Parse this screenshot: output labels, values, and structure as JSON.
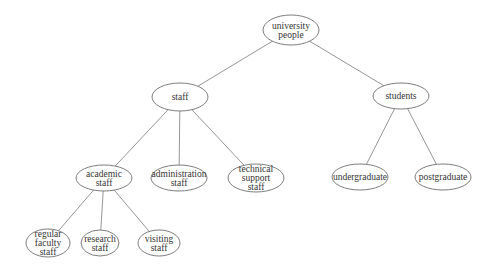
{
  "diagram": {
    "type": "tree",
    "nodes": [
      {
        "id": "root",
        "lines": [
          "university",
          "people"
        ],
        "cx": 291,
        "cy": 30,
        "rx": 28,
        "ry": 15
      },
      {
        "id": "staff",
        "lines": [
          "staff"
        ],
        "cx": 180,
        "cy": 97,
        "rx": 28,
        "ry": 14
      },
      {
        "id": "students",
        "lines": [
          "students"
        ],
        "cx": 401,
        "cy": 96,
        "rx": 28,
        "ry": 13
      },
      {
        "id": "academic",
        "lines": [
          "academic",
          "staff"
        ],
        "cx": 104,
        "cy": 178,
        "rx": 28,
        "ry": 13
      },
      {
        "id": "administration",
        "lines": [
          "administration",
          "staff"
        ],
        "cx": 179,
        "cy": 178,
        "rx": 28,
        "ry": 13
      },
      {
        "id": "technical",
        "lines": [
          "technical",
          "support",
          "staff"
        ],
        "cx": 256,
        "cy": 178,
        "rx": 28,
        "ry": 14
      },
      {
        "id": "undergraduate",
        "lines": [
          "undergraduate"
        ],
        "cx": 360,
        "cy": 177,
        "rx": 28,
        "ry": 13
      },
      {
        "id": "postgraduate",
        "lines": [
          "postgraduate"
        ],
        "cx": 443,
        "cy": 177,
        "rx": 28,
        "ry": 13
      },
      {
        "id": "regular",
        "lines": [
          "regular",
          "faculty",
          "staff"
        ],
        "cx": 48,
        "cy": 243,
        "rx": 22,
        "ry": 14
      },
      {
        "id": "research",
        "lines": [
          "research",
          "staff"
        ],
        "cx": 100,
        "cy": 243,
        "rx": 19,
        "ry": 13
      },
      {
        "id": "visiting",
        "lines": [
          "visiting",
          "staff"
        ],
        "cx": 159,
        "cy": 243,
        "rx": 21,
        "ry": 13
      }
    ],
    "edges": [
      [
        "root",
        "staff"
      ],
      [
        "root",
        "students"
      ],
      [
        "staff",
        "academic"
      ],
      [
        "staff",
        "administration"
      ],
      [
        "staff",
        "technical"
      ],
      [
        "students",
        "undergraduate"
      ],
      [
        "students",
        "postgraduate"
      ],
      [
        "academic",
        "regular"
      ],
      [
        "academic",
        "research"
      ],
      [
        "academic",
        "visiting"
      ]
    ]
  }
}
